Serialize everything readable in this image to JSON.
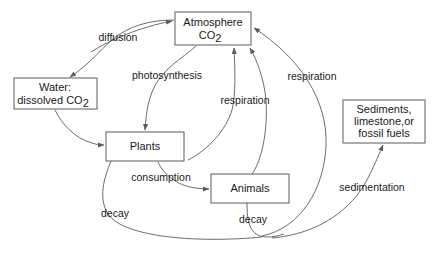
{
  "diagram": {
    "background_color": "#ffffff",
    "box_stroke_color": "#5b5b5b",
    "arrow_color": "#5b5b5b",
    "text_color": "#1a1a1a",
    "nodes": [
      {
        "id": "atmosphere",
        "line1": "Atmosphere",
        "line2": "CO",
        "sub2": "2",
        "x": 175,
        "y": 12,
        "w": 76,
        "h": 33
      },
      {
        "id": "water",
        "line1": "Water:",
        "line2": "dissolved CO",
        "sub2": "2",
        "x": 14,
        "y": 78,
        "w": 83,
        "h": 31
      },
      {
        "id": "plants",
        "line1": "Plants",
        "line2": "",
        "sub2": "",
        "x": 106,
        "y": 132,
        "w": 78,
        "h": 29
      },
      {
        "id": "animals",
        "line1": "Animals",
        "line2": "",
        "sub2": "",
        "x": 211,
        "y": 174,
        "w": 78,
        "h": 29
      },
      {
        "id": "sediments",
        "line1": "Sediments,",
        "line2": "limestone,or",
        "line3": "fossil fuels",
        "x": 343,
        "y": 100,
        "w": 82,
        "h": 43
      }
    ],
    "edges": [
      {
        "id": "diffusion",
        "label": "diffusion",
        "from": "atmosphere",
        "to": "water",
        "label_x": 118,
        "label_y": 38
      },
      {
        "id": "photosynthesis",
        "label": "photosynthesis",
        "from": "atmosphere",
        "to": "plants",
        "label_x": 167,
        "label_y": 76
      },
      {
        "id": "respiration-plants",
        "label": "respiration",
        "from": "plants",
        "to": "atmosphere",
        "label_x": 245,
        "label_y": 101
      },
      {
        "id": "respiration-animals",
        "label": "respiration",
        "from": "animals",
        "to": "atmosphere",
        "label_x": 312,
        "label_y": 77
      },
      {
        "id": "consumption",
        "label": "consumption",
        "from": "plants",
        "to": "animals",
        "label_x": 161,
        "label_y": 178
      },
      {
        "id": "decay-plants",
        "label": "decay",
        "from": "plants",
        "to": "bottom",
        "label_x": 115,
        "label_y": 214
      },
      {
        "id": "decay-animals",
        "label": "decay",
        "from": "animals",
        "to": "bottom",
        "label_x": 253,
        "label_y": 220
      },
      {
        "id": "sedimentation",
        "label": "sedimentation",
        "from": "bottom",
        "to": "sediments",
        "label_x": 372,
        "label_y": 188
      },
      {
        "id": "water-to-plants",
        "label": "",
        "from": "water",
        "to": "plants",
        "label_x": 0,
        "label_y": 0
      }
    ]
  }
}
